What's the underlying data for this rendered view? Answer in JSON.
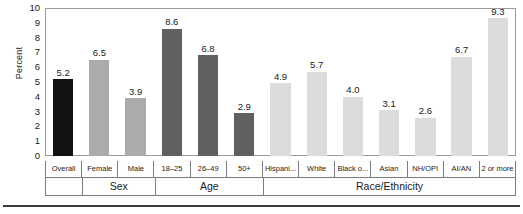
{
  "chart_data": {
    "type": "bar",
    "title": "",
    "subtitle": "",
    "xlabel": "",
    "ylabel": "Percent",
    "ylim": [
      0,
      10
    ],
    "ytick_step": 1,
    "yticks": [
      "10",
      "9",
      "8",
      "7",
      "6",
      "5",
      "4",
      "3",
      "2",
      "1",
      "0"
    ],
    "grid": false,
    "legend": "none",
    "categories": [
      "Overall",
      "Female",
      "Male",
      "18–25",
      "26–49",
      "50+",
      "Hispani...",
      "White",
      "Black o...",
      "Asian",
      "NH/OPI",
      "AI/AN",
      "2 or more"
    ],
    "values": [
      5.2,
      6.5,
      3.9,
      8.6,
      6.8,
      2.9,
      4.9,
      5.7,
      4.0,
      3.1,
      2.6,
      6.7,
      9.3
    ],
    "value_labels": [
      "5.2",
      "6.5",
      "3.9",
      "8.6",
      "6.8",
      "2.9",
      "4.9",
      "5.7",
      "4.0",
      "3.1",
      "2.6",
      "6.7",
      "9.3"
    ],
    "bar_colors": [
      "#121212",
      "#ababab",
      "#ababab",
      "#606060",
      "#606060",
      "#606060",
      "#dcdcdc",
      "#dcdcdc",
      "#dcdcdc",
      "#dcdcdc",
      "#dcdcdc",
      "#dcdcdc",
      "#dcdcdc"
    ],
    "groups": [
      {
        "label": "",
        "span": 1
      },
      {
        "label": "Sex",
        "span": 2
      },
      {
        "label": "Age",
        "span": 3
      },
      {
        "label": "Race/Ethnicity",
        "span": 7
      }
    ],
    "colors": {
      "overall_bar": "#121212",
      "sex_bar": "#ababab",
      "age_bar": "#606060",
      "race_bar": "#dcdcdc",
      "axis_line": "#9a9a9a",
      "table_line": "#7d7d7d",
      "text": "#1a1a1a",
      "bottom_rule": "#3c3c3c",
      "background": "#ffffff"
    }
  }
}
